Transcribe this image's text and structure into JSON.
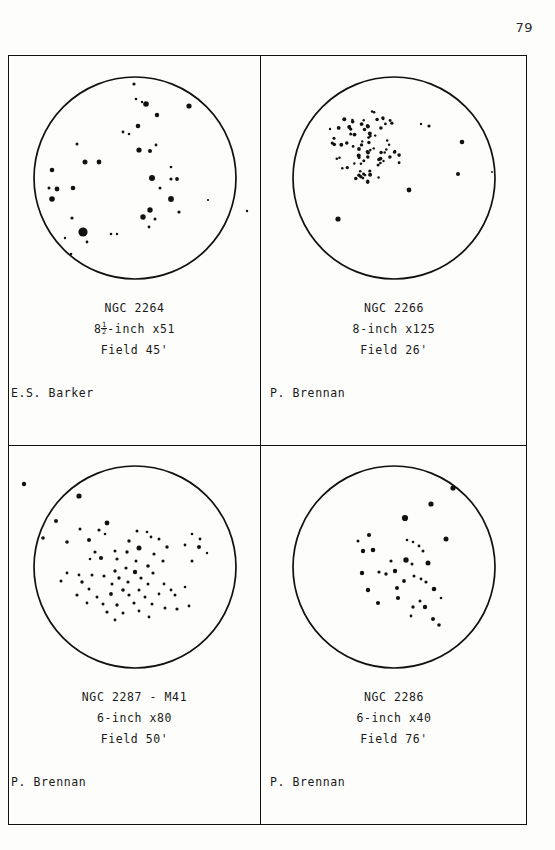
{
  "page": {
    "number": "79"
  },
  "panels": [
    {
      "id": "ngc-2264",
      "position": "top-left",
      "object": "NGC 2264",
      "instrument_prefix": "8",
      "instrument_fraction_num": "1",
      "instrument_fraction_den": "2",
      "instrument_suffix": "-inch x51",
      "instrument_plain": "8½-inch x51",
      "field": "Field 45'",
      "observer": "E.S. Barker"
    },
    {
      "id": "ngc-2266",
      "position": "top-right",
      "object": "NGC 2266",
      "instrument_plain": "8-inch x125",
      "field": "Field 26'",
      "observer": "P. Brennan"
    },
    {
      "id": "ngc-2287-m41",
      "position": "bottom-left",
      "object": "NGC 2287 - M41",
      "instrument_plain": "6-inch x80",
      "field": "Field 50'",
      "observer": "P. Brennan"
    },
    {
      "id": "ngc-2286",
      "position": "bottom-right",
      "object": "NGC 2286",
      "instrument_plain": "6-inch x40",
      "field": "Field 76'",
      "observer": "P. Brennan"
    }
  ],
  "chart_data": [
    {
      "type": "scatter",
      "title": "NGC 2264",
      "subtitle": "8½-inch x51, Field 45'",
      "xlabel": "",
      "ylabel": "",
      "xlim": [
        0,
        232
      ],
      "ylim": [
        0,
        232
      ],
      "grid": false,
      "legend": "none",
      "field_circle": {
        "cx": 116,
        "cy": 116,
        "r": 101
      },
      "note": "Scattered open cluster; one dominant bright star lower-left.",
      "points": [
        {
          "x": 115,
          "y": 22,
          "r": 1.6
        },
        {
          "x": 117,
          "y": 37,
          "r": 1.3
        },
        {
          "x": 123,
          "y": 40,
          "r": 1.2
        },
        {
          "x": 127,
          "y": 42,
          "r": 2.8
        },
        {
          "x": 170,
          "y": 44,
          "r": 2.6
        },
        {
          "x": 138,
          "y": 53,
          "r": 2.2
        },
        {
          "x": 119,
          "y": 64,
          "r": 2.3
        },
        {
          "x": 104,
          "y": 70,
          "r": 1.4
        },
        {
          "x": 110,
          "y": 72,
          "r": 1.3
        },
        {
          "x": 58,
          "y": 82,
          "r": 1.5
        },
        {
          "x": 137,
          "y": 83,
          "r": 1.4
        },
        {
          "x": 120,
          "y": 88,
          "r": 2.6
        },
        {
          "x": 131,
          "y": 89,
          "r": 2.0
        },
        {
          "x": 66,
          "y": 100,
          "r": 2.5
        },
        {
          "x": 80,
          "y": 100,
          "r": 2.4
        },
        {
          "x": 33,
          "y": 108,
          "r": 2.3
        },
        {
          "x": 152,
          "y": 105,
          "r": 1.3
        },
        {
          "x": 133,
          "y": 116,
          "r": 3.0
        },
        {
          "x": 152,
          "y": 117,
          "r": 1.6
        },
        {
          "x": 158,
          "y": 117,
          "r": 1.9
        },
        {
          "x": 30,
          "y": 126,
          "r": 1.5
        },
        {
          "x": 38,
          "y": 127,
          "r": 2.4
        },
        {
          "x": 54,
          "y": 126,
          "r": 2.3
        },
        {
          "x": 141,
          "y": 126,
          "r": 1.5
        },
        {
          "x": 33,
          "y": 137,
          "r": 2.8
        },
        {
          "x": 152,
          "y": 137,
          "r": 2.9
        },
        {
          "x": 241,
          "y": 137,
          "r": 1.2
        },
        {
          "x": 189,
          "y": 138,
          "r": 1.1
        },
        {
          "x": 131,
          "y": 148,
          "r": 2.7
        },
        {
          "x": 160,
          "y": 150,
          "r": 1.6
        },
        {
          "x": 124,
          "y": 155,
          "r": 2.7
        },
        {
          "x": 136,
          "y": 157,
          "r": 1.5
        },
        {
          "x": 228,
          "y": 149,
          "r": 1.2
        },
        {
          "x": 239,
          "y": 148,
          "r": 2.0
        },
        {
          "x": 53,
          "y": 156,
          "r": 1.6
        },
        {
          "x": 130,
          "y": 165,
          "r": 1.4
        },
        {
          "x": 64,
          "y": 170,
          "r": 4.6
        },
        {
          "x": 92,
          "y": 172,
          "r": 1.3
        },
        {
          "x": 98,
          "y": 172,
          "r": 1.2
        },
        {
          "x": 46,
          "y": 176,
          "r": 1.2
        },
        {
          "x": 68,
          "y": 180,
          "r": 1.4
        },
        {
          "x": 52,
          "y": 192,
          "r": 1.3
        }
      ]
    },
    {
      "type": "scatter",
      "title": "NGC 2266",
      "subtitle": "8-inch x125, Field 26'",
      "xlabel": "",
      "ylabel": "",
      "xlim": [
        0,
        232
      ],
      "ylim": [
        0,
        232
      ],
      "grid": false,
      "legend": "none",
      "field_circle": {
        "cx": 116,
        "cy": 116,
        "r": 101
      },
      "note": "Rich compact cluster concentrated upper-left of field plus a few isolated field stars.",
      "cluster_core": {
        "cx": 88,
        "cy": 85,
        "rx": 38,
        "ry": 36,
        "count": 78,
        "star_r": 1.5
      },
      "points": [
        {
          "x": 143,
          "y": 62,
          "r": 1.2
        },
        {
          "x": 151,
          "y": 64,
          "r": 1.6
        },
        {
          "x": 52,
          "y": 67,
          "r": 1.2
        },
        {
          "x": 184,
          "y": 80,
          "r": 2.3
        },
        {
          "x": 180,
          "y": 112,
          "r": 2.0
        },
        {
          "x": 214,
          "y": 110,
          "r": 1.0
        },
        {
          "x": 131,
          "y": 128,
          "r": 2.4
        },
        {
          "x": 60,
          "y": 157,
          "r": 2.6
        }
      ]
    },
    {
      "type": "scatter",
      "title": "NGC 2287 - M41",
      "subtitle": "6-inch x80, Field 50'",
      "xlabel": "",
      "ylabel": "",
      "xlim": [
        0,
        232
      ],
      "ylim": [
        0,
        232
      ],
      "grid": false,
      "legend": "none",
      "field_circle": {
        "cx": 116,
        "cy": 116,
        "r": 101
      },
      "note": "Large loose cluster filling centre of field; two stars plotted outside the field circle at upper left.",
      "points": [
        {
          "x": 5,
          "y": 33,
          "r": 2.2
        },
        {
          "x": 60,
          "y": 45,
          "r": 2.6
        },
        {
          "x": 37,
          "y": 70,
          "r": 2.0
        },
        {
          "x": 88,
          "y": 72,
          "r": 2.4
        },
        {
          "x": 61,
          "y": 78,
          "r": 1.5
        },
        {
          "x": 80,
          "y": 79,
          "r": 1.6
        },
        {
          "x": 118,
          "y": 80,
          "r": 1.5
        },
        {
          "x": 128,
          "y": 81,
          "r": 1.3
        },
        {
          "x": 24,
          "y": 87,
          "r": 1.8
        },
        {
          "x": 86,
          "y": 83,
          "r": 1.3
        },
        {
          "x": 132,
          "y": 86,
          "r": 1.4
        },
        {
          "x": 173,
          "y": 83,
          "r": 1.3
        },
        {
          "x": 48,
          "y": 91,
          "r": 1.8
        },
        {
          "x": 70,
          "y": 89,
          "r": 2.0
        },
        {
          "x": 110,
          "y": 90,
          "r": 1.7
        },
        {
          "x": 181,
          "y": 88,
          "r": 1.4
        },
        {
          "x": 140,
          "y": 88,
          "r": 1.5
        },
        {
          "x": 166,
          "y": 94,
          "r": 1.4
        },
        {
          "x": 180,
          "y": 96,
          "r": 2.0
        },
        {
          "x": 120,
          "y": 97,
          "r": 2.5
        },
        {
          "x": 148,
          "y": 96,
          "r": 1.7
        },
        {
          "x": 76,
          "y": 101,
          "r": 1.6
        },
        {
          "x": 96,
          "y": 100,
          "r": 1.5
        },
        {
          "x": 108,
          "y": 101,
          "r": 1.7
        },
        {
          "x": 135,
          "y": 103,
          "r": 1.6
        },
        {
          "x": 188,
          "y": 102,
          "r": 1.2
        },
        {
          "x": 71,
          "y": 108,
          "r": 1.3
        },
        {
          "x": 82,
          "y": 107,
          "r": 2.1
        },
        {
          "x": 98,
          "y": 108,
          "r": 1.6
        },
        {
          "x": 117,
          "y": 110,
          "r": 1.5
        },
        {
          "x": 144,
          "y": 110,
          "r": 1.6
        },
        {
          "x": 173,
          "y": 110,
          "r": 1.5
        },
        {
          "x": 107,
          "y": 117,
          "r": 1.6
        },
        {
          "x": 129,
          "y": 115,
          "r": 1.8
        },
        {
          "x": 96,
          "y": 120,
          "r": 1.7
        },
        {
          "x": 116,
          "y": 121,
          "r": 2.2
        },
        {
          "x": 134,
          "y": 122,
          "r": 1.6
        },
        {
          "x": 48,
          "y": 122,
          "r": 1.4
        },
        {
          "x": 60,
          "y": 124,
          "r": 1.4
        },
        {
          "x": 73,
          "y": 124,
          "r": 1.5
        },
        {
          "x": 85,
          "y": 125,
          "r": 1.6
        },
        {
          "x": 100,
          "y": 127,
          "r": 1.7
        },
        {
          "x": 122,
          "y": 127,
          "r": 1.6
        },
        {
          "x": 42,
          "y": 130,
          "r": 1.5
        },
        {
          "x": 63,
          "y": 131,
          "r": 1.7
        },
        {
          "x": 93,
          "y": 133,
          "r": 1.5
        },
        {
          "x": 109,
          "y": 131,
          "r": 1.6
        },
        {
          "x": 129,
          "y": 133,
          "r": 1.5
        },
        {
          "x": 145,
          "y": 133,
          "r": 1.4
        },
        {
          "x": 70,
          "y": 138,
          "r": 1.5
        },
        {
          "x": 104,
          "y": 139,
          "r": 1.8
        },
        {
          "x": 120,
          "y": 139,
          "r": 1.5
        },
        {
          "x": 152,
          "y": 139,
          "r": 1.4
        },
        {
          "x": 166,
          "y": 136,
          "r": 1.3
        },
        {
          "x": 58,
          "y": 144,
          "r": 1.6
        },
        {
          "x": 78,
          "y": 146,
          "r": 1.5
        },
        {
          "x": 92,
          "y": 143,
          "r": 1.9
        },
        {
          "x": 110,
          "y": 144,
          "r": 1.6
        },
        {
          "x": 126,
          "y": 146,
          "r": 1.5
        },
        {
          "x": 140,
          "y": 143,
          "r": 1.4
        },
        {
          "x": 156,
          "y": 144,
          "r": 1.5
        },
        {
          "x": 68,
          "y": 152,
          "r": 1.4
        },
        {
          "x": 84,
          "y": 153,
          "r": 1.5
        },
        {
          "x": 98,
          "y": 154,
          "r": 1.7
        },
        {
          "x": 115,
          "y": 152,
          "r": 1.6
        },
        {
          "x": 133,
          "y": 153,
          "r": 1.5
        },
        {
          "x": 88,
          "y": 161,
          "r": 1.6
        },
        {
          "x": 104,
          "y": 162,
          "r": 1.5
        },
        {
          "x": 120,
          "y": 160,
          "r": 1.4
        },
        {
          "x": 146,
          "y": 157,
          "r": 1.5
        },
        {
          "x": 158,
          "y": 158,
          "r": 1.6
        },
        {
          "x": 170,
          "y": 155,
          "r": 1.4
        },
        {
          "x": 96,
          "y": 169,
          "r": 1.4
        },
        {
          "x": 130,
          "y": 166,
          "r": 1.4
        }
      ]
    },
    {
      "type": "scatter",
      "title": "NGC 2286",
      "subtitle": "6-inch x40, Field 76'",
      "xlabel": "",
      "ylabel": "",
      "xlim": [
        0,
        232
      ],
      "ylim": [
        0,
        232
      ],
      "grid": false,
      "legend": "none",
      "field_circle": {
        "cx": 116,
        "cy": 116,
        "r": 101
      },
      "note": "Loose scattered group, brighter members toward upper right of field.",
      "points": [
        {
          "x": 175,
          "y": 37,
          "r": 2.6
        },
        {
          "x": 153,
          "y": 53,
          "r": 2.6
        },
        {
          "x": 127,
          "y": 67,
          "r": 3.1
        },
        {
          "x": 91,
          "y": 84,
          "r": 2.1
        },
        {
          "x": 168,
          "y": 88,
          "r": 2.5
        },
        {
          "x": 80,
          "y": 90,
          "r": 1.5
        },
        {
          "x": 129,
          "y": 89,
          "r": 1.3
        },
        {
          "x": 135,
          "y": 91,
          "r": 1.3
        },
        {
          "x": 141,
          "y": 95,
          "r": 1.4
        },
        {
          "x": 95,
          "y": 99,
          "r": 2.3
        },
        {
          "x": 85,
          "y": 100,
          "r": 2.2
        },
        {
          "x": 145,
          "y": 100,
          "r": 1.5
        },
        {
          "x": 113,
          "y": 110,
          "r": 1.6
        },
        {
          "x": 128,
          "y": 109,
          "r": 2.7
        },
        {
          "x": 134,
          "y": 113,
          "r": 1.5
        },
        {
          "x": 150,
          "y": 112,
          "r": 2.5
        },
        {
          "x": 84,
          "y": 122,
          "r": 2.2
        },
        {
          "x": 101,
          "y": 121,
          "r": 1.6
        },
        {
          "x": 108,
          "y": 123,
          "r": 1.7
        },
        {
          "x": 117,
          "y": 120,
          "r": 2.2
        },
        {
          "x": 136,
          "y": 125,
          "r": 1.5
        },
        {
          "x": 143,
          "y": 128,
          "r": 1.4
        },
        {
          "x": 126,
          "y": 130,
          "r": 1.9
        },
        {
          "x": 148,
          "y": 131,
          "r": 1.6
        },
        {
          "x": 90,
          "y": 139,
          "r": 2.2
        },
        {
          "x": 119,
          "y": 137,
          "r": 2.0
        },
        {
          "x": 156,
          "y": 138,
          "r": 2.3
        },
        {
          "x": 120,
          "y": 147,
          "r": 2.1
        },
        {
          "x": 100,
          "y": 152,
          "r": 2.1
        },
        {
          "x": 142,
          "y": 150,
          "r": 1.5
        },
        {
          "x": 163,
          "y": 147,
          "r": 1.3
        },
        {
          "x": 135,
          "y": 156,
          "r": 1.7
        },
        {
          "x": 147,
          "y": 156,
          "r": 2.2
        },
        {
          "x": 133,
          "y": 165,
          "r": 1.4
        },
        {
          "x": 155,
          "y": 168,
          "r": 2.0
        },
        {
          "x": 161,
          "y": 174,
          "r": 1.8
        }
      ]
    }
  ]
}
